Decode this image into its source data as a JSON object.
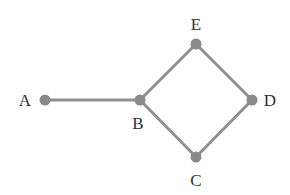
{
  "diagram": {
    "type": "undirected-graph",
    "colors": {
      "edge": "#8f8f8f",
      "node": "#8a8a8a",
      "label": "#2f2f2f",
      "background": "#ffffff"
    },
    "nodes": [
      {
        "id": "A",
        "label": "A",
        "x": 45,
        "y": 100,
        "label_x": 25,
        "label_y": 106
      },
      {
        "id": "B",
        "label": "B",
        "x": 140,
        "y": 100,
        "label_x": 138,
        "label_y": 129
      },
      {
        "id": "E",
        "label": "E",
        "x": 196,
        "y": 44,
        "label_x": 196,
        "label_y": 30
      },
      {
        "id": "D",
        "label": "D",
        "x": 252,
        "y": 100,
        "label_x": 270,
        "label_y": 106
      },
      {
        "id": "C",
        "label": "C",
        "x": 196,
        "y": 157,
        "label_x": 196,
        "label_y": 186
      }
    ],
    "edges": [
      {
        "from": "A",
        "to": "B"
      },
      {
        "from": "B",
        "to": "E"
      },
      {
        "from": "E",
        "to": "D"
      },
      {
        "from": "D",
        "to": "C"
      },
      {
        "from": "C",
        "to": "B"
      }
    ]
  }
}
